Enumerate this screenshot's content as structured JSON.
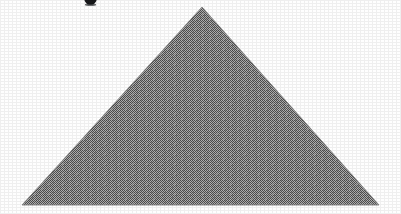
{
  "figure": {
    "background_color": "#fefefe",
    "width": 401,
    "height": 214,
    "shape": {
      "name": "triangle",
      "kind": "isoceles-triangle",
      "fill_label": "halftone dither gray",
      "fill_color": "#7d7d7d",
      "dither_dark": "#4a4a4a",
      "dither_light": "#b4b4b4",
      "edge_color": "#8a8a8a",
      "apex": {
        "x": 202,
        "y": 7
      },
      "bottom_left": {
        "x": 22,
        "y": 205
      },
      "bottom_right": {
        "x": 379,
        "y": 205
      },
      "base_width": 357,
      "height_px": 198
    },
    "clipped_glyph": {
      "name": "clipped-glyph-fragment",
      "description": "bottom of a bold character cropped by the top edge",
      "color": "#17181a",
      "x": 83,
      "y": -7,
      "width": 15,
      "height": 12
    },
    "grain": {
      "label": "scan grain",
      "opacity": 0.055
    }
  }
}
